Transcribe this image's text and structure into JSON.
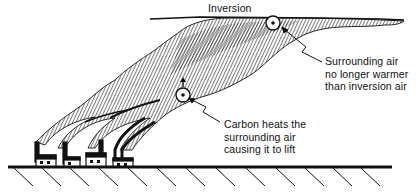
{
  "diagram": {
    "title": "Inversion",
    "labels": {
      "inversion": "Inversion",
      "surrounding_air": {
        "lines": [
          "Surrounding air",
          "no longer warmer",
          "than inversion air"
        ]
      },
      "carbon_heats": {
        "lines": [
          "Carbon heats the",
          "surrounding air",
          "causing it to lift"
        ]
      }
    },
    "elements": {
      "inversion_layer": "horizontal inversion line",
      "smoke_plume": "hatched smoke plume rising from factories and spreading under inversion",
      "factories": 4,
      "smokestacks": 5,
      "ground": "hatched ground line",
      "particle_markers": [
        "particle-upper",
        "particle-lower"
      ]
    },
    "colors": {
      "ink": "#111111",
      "background": "#ffffff"
    }
  }
}
